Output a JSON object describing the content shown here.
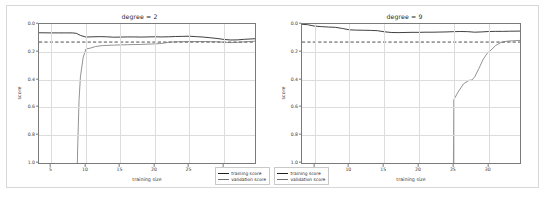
{
  "figure": {
    "xlabel": "training size",
    "ylabel": "score",
    "colors": {
      "training": "#1f1f1f",
      "validation": "#6f6f6f",
      "threshold": "#1f1f1f",
      "grid": "#dcdcdc",
      "axis": "#7a7a7a",
      "frame": "#d8d8d8"
    }
  },
  "panels": [
    {
      "title": "degree = 2",
      "legend": [
        {
          "label": "training score"
        },
        {
          "label": "validation score"
        }
      ],
      "yticks": [
        "1.0",
        "0.8",
        "0.6",
        "0.4",
        "0.2",
        "0.0"
      ],
      "xticks": [
        "5",
        "10",
        "15",
        "20",
        "25",
        "30"
      ]
    },
    {
      "title": "degree = 9",
      "legend": [
        {
          "label": "training score"
        },
        {
          "label": "validation score"
        }
      ],
      "yticks": [
        "1.0",
        "0.8",
        "0.6",
        "0.4",
        "0.2",
        "0.0"
      ],
      "xticks": [
        "5",
        "10",
        "15",
        "20",
        "25",
        "30"
      ]
    }
  ],
  "chart_data": [
    {
      "type": "line",
      "title": "degree = 2",
      "xlabel": "training size",
      "ylabel": "score",
      "xlim": [
        3.2,
        34.5
      ],
      "ylim": [
        0.0,
        1.0
      ],
      "grid": true,
      "legend_position": "lower right",
      "xticks": [
        5,
        10,
        15,
        20,
        25,
        30
      ],
      "yticks": [
        0.0,
        0.2,
        0.4,
        0.6,
        0.8,
        1.0
      ],
      "threshold_line": {
        "y": 0.87,
        "style": "dashed",
        "label": ""
      },
      "series": [
        {
          "name": "training score",
          "x": [
            3.2,
            5,
            6,
            7,
            8,
            8.6,
            9.2,
            10,
            11,
            12,
            13,
            14,
            15,
            16,
            17,
            18,
            19,
            20,
            21,
            22,
            23,
            24,
            25,
            26,
            27,
            28,
            29,
            30,
            31,
            32,
            33,
            34.5
          ],
          "y": [
            0.937,
            0.936,
            0.936,
            0.936,
            0.936,
            0.933,
            0.918,
            0.906,
            0.908,
            0.909,
            0.908,
            0.905,
            0.906,
            0.907,
            0.907,
            0.906,
            0.907,
            0.908,
            0.907,
            0.908,
            0.91,
            0.911,
            0.912,
            0.909,
            0.906,
            0.901,
            0.896,
            0.889,
            0.885,
            0.886,
            0.89,
            0.894
          ]
        },
        {
          "name": "validation score",
          "x": [
            8.6,
            8.8,
            9.0,
            9.2,
            9.6,
            10.0,
            10.6,
            11.4,
            12.4,
            14,
            16,
            18,
            20,
            21,
            22,
            23,
            24,
            25,
            26,
            27,
            28,
            29,
            30,
            31,
            32,
            33,
            34.5
          ],
          "y": [
            -0.4,
            0.1,
            0.45,
            0.62,
            0.76,
            0.82,
            0.826,
            0.838,
            0.845,
            0.848,
            0.851,
            0.853,
            0.857,
            0.86,
            0.869,
            0.872,
            0.873,
            0.874,
            0.874,
            0.874,
            0.873,
            0.872,
            0.869,
            0.866,
            0.868,
            0.872,
            0.876
          ]
        }
      ]
    },
    {
      "type": "line",
      "title": "degree = 9",
      "xlabel": "training size",
      "ylabel": "score",
      "xlim": [
        3.2,
        34.5
      ],
      "ylim": [
        0.0,
        1.0
      ],
      "grid": true,
      "legend_position": "lower left",
      "xticks": [
        5,
        10,
        15,
        20,
        25,
        30
      ],
      "yticks": [
        0.0,
        0.2,
        0.4,
        0.6,
        0.8,
        1.0
      ],
      "threshold_line": {
        "y": 0.87,
        "style": "dashed",
        "label": ""
      },
      "series": [
        {
          "name": "training score",
          "x": [
            3.2,
            4,
            5,
            6,
            7,
            8,
            9,
            10,
            11,
            12,
            13,
            14,
            15,
            16,
            17,
            18,
            19,
            20,
            21,
            22,
            23,
            24,
            25,
            26,
            27,
            28,
            29,
            30,
            31,
            32,
            33,
            34.5
          ],
          "y": [
            0.998,
            0.995,
            0.985,
            0.981,
            0.978,
            0.976,
            0.968,
            0.958,
            0.956,
            0.955,
            0.954,
            0.952,
            0.944,
            0.939,
            0.938,
            0.939,
            0.94,
            0.94,
            0.941,
            0.941,
            0.942,
            0.943,
            0.945,
            0.946,
            0.945,
            0.941,
            0.943,
            0.946,
            0.947,
            0.947,
            0.948,
            0.949
          ]
        },
        {
          "name": "validation score",
          "x": [
            24.9,
            25.0,
            25.6,
            26.4,
            27.2,
            27.6,
            28.0,
            28.6,
            29.2,
            29.8,
            30.2,
            31.0,
            31.8,
            32.6,
            33.4,
            34.5
          ],
          "y": [
            -0.35,
            0.455,
            0.51,
            0.57,
            0.595,
            0.597,
            0.62,
            0.68,
            0.745,
            0.79,
            0.806,
            0.845,
            0.868,
            0.876,
            0.879,
            0.882
          ]
        }
      ]
    }
  ]
}
